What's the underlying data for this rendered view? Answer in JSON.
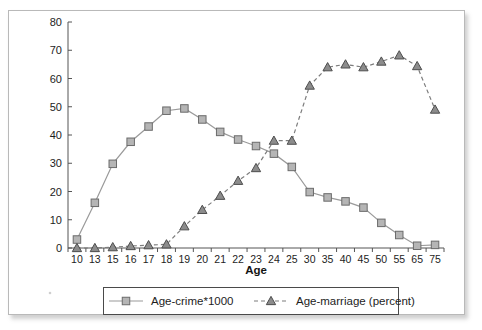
{
  "chart_data": {
    "type": "line",
    "title": "",
    "xlabel": "Age",
    "ylabel": "",
    "categories": [
      "10",
      "13",
      "15",
      "16",
      "17",
      "18",
      "19",
      "20",
      "21",
      "22",
      "23",
      "24",
      "25",
      "30",
      "35",
      "40",
      "45",
      "50",
      "55",
      "65",
      "75"
    ],
    "ylim": [
      0,
      80
    ],
    "ytick_values": [
      0,
      10,
      20,
      30,
      40,
      50,
      60,
      70,
      80
    ],
    "ytick_labels": [
      "0",
      "10",
      "20",
      "30",
      "40",
      "50",
      "60",
      "70",
      "80"
    ],
    "grid": false,
    "legend_position": "bottom",
    "series": [
      {
        "name": "Age-crime*1000",
        "marker": "square",
        "linestyle": "solid",
        "color": "#9a9a9a",
        "marker_fill": "#b5b5b5",
        "marker_stroke": "#6b6b6b",
        "values": [
          3,
          16,
          29.8,
          37.6,
          43,
          48.6,
          49.4,
          45.5,
          41.1,
          38.4,
          36.1,
          33.4,
          28.7,
          19.8,
          17.9,
          16.5,
          14.3,
          8.9,
          4.6,
          0.8,
          1.1
        ]
      },
      {
        "name": "Age-marriage (percent)",
        "marker": "triangle",
        "linestyle": "dashed",
        "color": "#7d7d7d",
        "marker_fill": "#8c8c8c",
        "marker_stroke": "#4d4d4d",
        "values": [
          0,
          0,
          0.3,
          0.7,
          1.0,
          1.3,
          7.7,
          13.5,
          18.5,
          23.8,
          28.3,
          38.0,
          38.0,
          57.5,
          64.0,
          65.0,
          64.0,
          66.0,
          68.2,
          64.4,
          49.0
        ]
      }
    ],
    "annotations": []
  },
  "legend": {
    "entries": [
      {
        "label": "Age-crime*1000",
        "marker": "square-marker-icon"
      },
      {
        "label": "Age-marriage (percent)",
        "marker": "triangle-marker-icon"
      }
    ]
  },
  "colors": {
    "frame_border": "#b9b9b9",
    "axis": "#555555",
    "text": "#1d1d1d",
    "background": "#ffffff"
  }
}
